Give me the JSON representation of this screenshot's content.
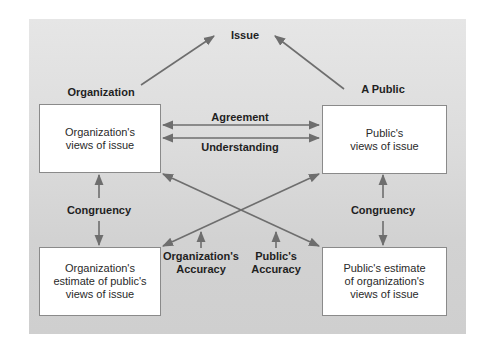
{
  "diagram": {
    "title_node": "Issue",
    "party_labels": {
      "organization": "Organization",
      "public": "A Public"
    },
    "boxes": {
      "org_views": "Organization's\nviews of issue",
      "public_views": "Public's\nviews of issue",
      "org_estimate": "Organization's\nestimate of public's\nviews of issue",
      "public_estimate": "Public's estimate\nof organization's\nviews of issue"
    },
    "relations": {
      "agreement": "Agreement",
      "understanding": "Understanding",
      "congruency_left": "Congruency",
      "congruency_right": "Congruency",
      "org_accuracy": "Organization's\nAccuracy",
      "public_accuracy": "Public's\nAccuracy"
    },
    "colors": {
      "arrow": "#6e6e6e",
      "panel_bg": "#dcdcdc",
      "box_bg": "#ffffff",
      "box_border": "#8a8a8a",
      "text": "#1f1f1f"
    }
  }
}
